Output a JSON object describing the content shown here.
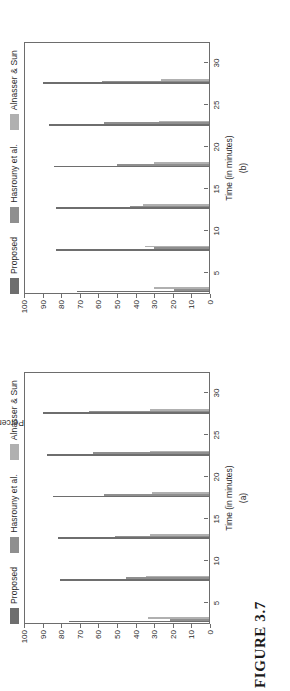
{
  "figure": {
    "caption": "FIGURE 3.7",
    "colors": {
      "series1": "#6e6e6e",
      "series2": "#8f8f8f",
      "series3": "#b0b0b0",
      "axis": "#6d6d6d",
      "text": "#2b2b2b",
      "background": "#ffffff"
    }
  },
  "charts": [
    {
      "id": "a",
      "subcaption": "(a)",
      "chart_data": {
        "type": "bar",
        "title": "",
        "xlabel": "Time (in minutes)",
        "ylabel": "Percentage of detection of bad-mouthing vehicles",
        "categories": [
          "5",
          "10",
          "15",
          "20",
          "25",
          "30"
        ],
        "xtick_labels": [
          "5",
          "10",
          "15",
          "20",
          "25",
          "30"
        ],
        "ytick_labels": [
          "0",
          "10",
          "20",
          "30",
          "40",
          "50",
          "60",
          "70",
          "80",
          "90",
          "100"
        ],
        "ylim": [
          0,
          100
        ],
        "grid": false,
        "legend_position": "top",
        "series": [
          {
            "name": "Proposed",
            "values": [
              76,
              81,
              82,
              85,
              88,
              90
            ]
          },
          {
            "name": "Hasrouny et al.",
            "values": [
              21,
              45,
              51,
              57,
              63,
              65
            ]
          },
          {
            "name": "Alnasser & Sun",
            "values": [
              33,
              34,
              32,
              31,
              32,
              32
            ]
          }
        ]
      }
    },
    {
      "id": "b",
      "subcaption": "(b)",
      "chart_data": {
        "type": "bar",
        "title": "",
        "xlabel": "Time (in minutes)",
        "ylabel": "Percentage of detection of self-promoting vehicles",
        "categories": [
          "5",
          "10",
          "15",
          "20",
          "25",
          "30"
        ],
        "xtick_labels": [
          "5",
          "10",
          "15",
          "20",
          "25",
          "30"
        ],
        "ytick_labels": [
          "0",
          "10",
          "20",
          "30",
          "40",
          "50",
          "60",
          "70",
          "80",
          "90",
          "100"
        ],
        "ylim": [
          0,
          100
        ],
        "grid": false,
        "legend_position": "top",
        "series": [
          {
            "name": "Proposed",
            "values": [
              72,
              83,
              83,
              84,
              87,
              90
            ]
          },
          {
            "name": "Hasrouny et al.",
            "values": [
              19,
              30,
              43,
              50,
              57,
              58
            ]
          },
          {
            "name": "Alnasser & Sun",
            "values": [
              30,
              35,
              36,
              30,
              27,
              26
            ]
          }
        ]
      }
    }
  ]
}
